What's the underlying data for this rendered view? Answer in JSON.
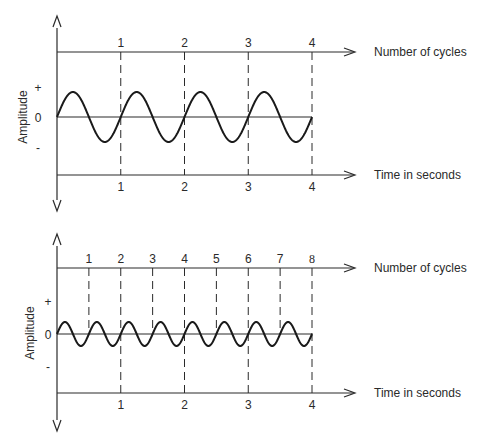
{
  "chart_data": [
    {
      "type": "line",
      "title": "",
      "xlabel_top": "Number of cycles",
      "xlabel_bottom": "Time in seconds",
      "ylabel": "Amplitude",
      "y_ticks": [
        "+",
        "0",
        "-"
      ],
      "cycle_ticks": [
        "1",
        "2",
        "3",
        "4"
      ],
      "time_ticks": [
        "1",
        "2",
        "3",
        "4"
      ],
      "frequency_hz": 1,
      "duration_s": 4,
      "cycles": 4,
      "amplitude_rel": 1.0,
      "series": [
        {
          "name": "sine wave",
          "function": "sin(2*pi*1*t)",
          "t_range": [
            0,
            4
          ]
        }
      ]
    },
    {
      "type": "line",
      "title": "",
      "xlabel_top": "Number of cycles",
      "xlabel_bottom": "Time in seconds",
      "ylabel": "Amplitude",
      "y_ticks": [
        "+",
        "0",
        "-"
      ],
      "cycle_ticks": [
        "1",
        "2",
        "3",
        "4",
        "5",
        "6",
        "7",
        "8"
      ],
      "time_ticks": [
        "1",
        "2",
        "3",
        "4"
      ],
      "frequency_hz": 2,
      "duration_s": 4,
      "cycles": 8,
      "amplitude_rel": 0.5,
      "series": [
        {
          "name": "sine wave",
          "function": "0.5*sin(2*pi*2*t)",
          "t_range": [
            0,
            4
          ]
        }
      ]
    }
  ],
  "panels": [
    {
      "ylabel": "Amplitude",
      "plus": "+",
      "zero": "0",
      "minus": "-",
      "top_axis_label": "Number of cycles",
      "bottom_axis_label": "Time in seconds",
      "cycle_ticks": [
        "1",
        "2",
        "3",
        "4"
      ],
      "time_ticks": [
        "1",
        "2",
        "3",
        "4"
      ]
    },
    {
      "ylabel": "Amplitude",
      "plus": "+",
      "zero": "0",
      "minus": "-",
      "top_axis_label": "Number of cycles",
      "bottom_axis_label": "Time in seconds",
      "cycle_ticks": [
        "1",
        "2",
        "3",
        "4",
        "5",
        "6",
        "7",
        "8"
      ],
      "time_ticks": [
        "1",
        "2",
        "3",
        "4"
      ]
    }
  ],
  "colors": {
    "ink": "#2a2a2a",
    "background": "#ffffff"
  }
}
